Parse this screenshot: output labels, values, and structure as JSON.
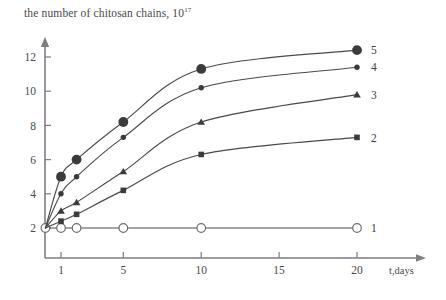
{
  "chart_data": {
    "type": "line",
    "title": "the number of chitosan chains, 10",
    "title_exponent": "17",
    "ylabel": "",
    "xlabel": "t,days",
    "x": [
      0,
      1,
      2,
      5,
      10,
      20
    ],
    "xticks": [
      1,
      5,
      10,
      15,
      20
    ],
    "yticks": [
      2,
      4,
      6,
      8,
      10,
      12
    ],
    "xlim": [
      0,
      22.5
    ],
    "ylim": [
      0,
      13
    ],
    "grid": false,
    "legend_position": "right-inline",
    "series": [
      {
        "name": "1",
        "label": "1",
        "marker": "open-circle",
        "x": [
          0,
          1,
          2,
          5,
          10,
          20
        ],
        "values": [
          2,
          2,
          2,
          2,
          2,
          2
        ]
      },
      {
        "name": "2",
        "label": "2",
        "marker": "filled-square",
        "x": [
          0,
          1,
          2,
          5,
          10,
          20
        ],
        "values": [
          2,
          2.4,
          2.8,
          4.2,
          6.3,
          7.3
        ]
      },
      {
        "name": "3",
        "label": "3",
        "marker": "filled-triangle",
        "x": [
          0,
          1,
          2,
          5,
          10,
          20
        ],
        "values": [
          2,
          3.0,
          3.5,
          5.3,
          8.2,
          9.8
        ]
      },
      {
        "name": "4",
        "label": "4",
        "marker": "small-filled-circle",
        "x": [
          0,
          1,
          2,
          5,
          10,
          20
        ],
        "values": [
          2,
          4.0,
          5.0,
          7.3,
          10.2,
          11.4
        ]
      },
      {
        "name": "5",
        "label": "5",
        "marker": "large-filled-circle",
        "x": [
          0,
          1,
          2,
          5,
          10,
          20
        ],
        "values": [
          2,
          5.0,
          6.0,
          8.2,
          11.3,
          12.4
        ]
      }
    ]
  }
}
